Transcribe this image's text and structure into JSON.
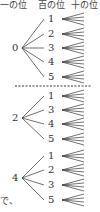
{
  "header": {
    "ones_place": "一の位",
    "hundreds_place": "百の位",
    "tens_place": "十の位"
  },
  "trees": [
    {
      "root": "0",
      "root_y": 48,
      "children": [
        {
          "label": "1",
          "y": 19
        },
        {
          "label": "2",
          "y": 34
        },
        {
          "label": "3",
          "y": 48
        },
        {
          "label": "4",
          "y": 62
        },
        {
          "label": "5",
          "y": 77
        }
      ]
    },
    {
      "root": "2",
      "root_y": 118,
      "children": [
        {
          "label": "1",
          "y": 96
        },
        {
          "label": "3",
          "y": 110
        },
        {
          "label": "4",
          "y": 124
        },
        {
          "label": "5",
          "y": 139
        }
      ]
    },
    {
      "root": "4",
      "root_y": 178,
      "children": [
        {
          "label": "1",
          "y": 156
        },
        {
          "label": "2",
          "y": 170
        },
        {
          "label": "3",
          "y": 185
        },
        {
          "label": "5",
          "y": 200
        }
      ]
    }
  ],
  "fan_lines_per_node": 4,
  "divider": {
    "y": 86,
    "x1": 15,
    "x2": 92,
    "style": "dashed"
  },
  "fragment_text": "で、",
  "colors": {
    "ink": "#333333",
    "background": "#ffffff"
  }
}
